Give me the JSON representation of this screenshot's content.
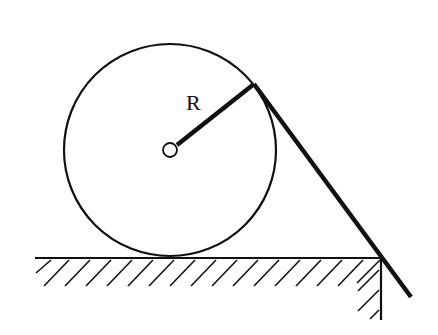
{
  "diagram": {
    "labels": {
      "radius": "R"
    },
    "colors": {
      "stroke": "#111111",
      "background": "#ffffff"
    },
    "circle": {
      "cx": 170,
      "cy": 150,
      "r": 106
    },
    "center_pin": {
      "cx": 170,
      "cy": 150,
      "r": 7
    },
    "radius_line": {
      "x1": 177,
      "y1": 146,
      "x2": 254,
      "y2": 84
    },
    "rod": {
      "x1": 254,
      "y1": 84,
      "x2": 411,
      "y2": 297
    },
    "ground": {
      "y": 258,
      "x1": 35,
      "x2": 381
    },
    "wall": {
      "x": 381,
      "y1": 258,
      "y2": 320
    }
  }
}
